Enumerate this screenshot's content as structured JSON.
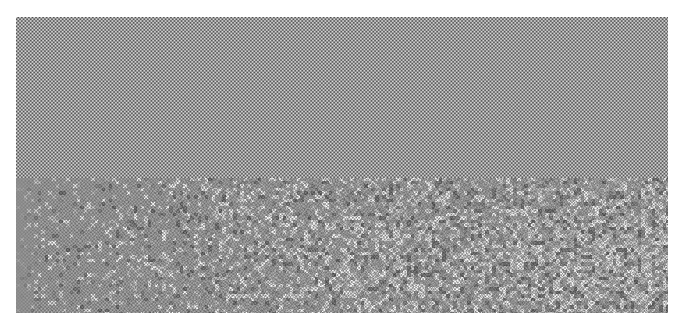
{
  "figure": {
    "kind": "simulation-snapshot",
    "background_color": "#ffffff"
  },
  "canvas": {
    "image_width": 683,
    "image_height": 330,
    "content_left": 16,
    "content_top": 17,
    "content_width": 652,
    "content_height": 296
  },
  "chart_data": {
    "type": "heatmap",
    "title": "",
    "subtitle": "",
    "xlabel": "",
    "ylabel": "",
    "grid": false,
    "legend": "none",
    "colormap": "grayscale",
    "value_range": [
      0,
      255
    ],
    "cell_pitch_px": 3.55,
    "regions": [
      {
        "name": "ordered-phase",
        "label": "ordered crystalline checkerboard",
        "y_start": 0,
        "y_end": 161,
        "order_parameter": 1.0,
        "mean_gray": 150,
        "contrast": 78,
        "disorder_left": 0.0,
        "disorder_right": 0.0
      },
      {
        "name": "disordered-phase",
        "label": "disordered melt with lateral gradient",
        "y_start": 161,
        "y_end": 296,
        "order_parameter": 0.25,
        "mean_gray": 140,
        "contrast": 34,
        "disorder_left": 0.12,
        "disorder_right": 1.0
      }
    ],
    "interface": {
      "orientation": "horizontal",
      "y_position_px": 178,
      "sharpness": "sharp"
    },
    "annotations": []
  },
  "palette": {
    "dark_cell": "#4a4a4a",
    "light_cell": "#d2d2d2",
    "mid_gray": "#8d8d8d",
    "defect_bright": "#f0f0f0",
    "defect_dark": "#3c3c3c",
    "paper_white": "#ffffff"
  }
}
